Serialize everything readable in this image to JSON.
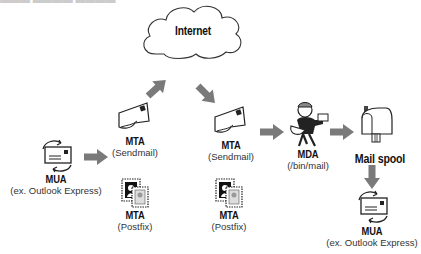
{
  "diagram": {
    "cloud": {
      "label": "Internet"
    },
    "nodes": [
      {
        "id": "mua-sender",
        "title": "MUA",
        "subtitle": "(ex. Outlook Express)",
        "icon": "mail-client-icon"
      },
      {
        "id": "mta-sendmail-1",
        "title": "MTA",
        "subtitle": "(Sendmail)",
        "icon": "envelope-hand-icon"
      },
      {
        "id": "mta-postfix-1",
        "title": "MTA",
        "subtitle": "(Postfix)",
        "icon": "postage-stamp-icon"
      },
      {
        "id": "mta-sendmail-2",
        "title": "MTA",
        "subtitle": "(Sendmail)",
        "icon": "envelope-hand-icon"
      },
      {
        "id": "mta-postfix-2",
        "title": "MTA",
        "subtitle": "(Postfix)",
        "icon": "postage-stamp-icon"
      },
      {
        "id": "mda",
        "title": "MDA",
        "subtitle": "(/bin/mail)",
        "icon": "mail-carrier-icon"
      },
      {
        "id": "mail-spool",
        "title": "Mail spool",
        "subtitle": "",
        "icon": "mailbox-icon"
      },
      {
        "id": "mua-receiver",
        "title": "MUA",
        "subtitle": "(ex. Outlook Express)",
        "icon": "mail-client-icon"
      }
    ],
    "edges": [
      {
        "from": "mua-sender",
        "to": "mta-sendmail-1"
      },
      {
        "from": "mta-sendmail-1",
        "to": "internet"
      },
      {
        "from": "internet",
        "to": "mta-sendmail-2"
      },
      {
        "from": "mta-sendmail-2",
        "to": "mda"
      },
      {
        "from": "mda",
        "to": "mail-spool"
      },
      {
        "from": "mail-spool",
        "to": "mua-receiver"
      }
    ],
    "colors": {
      "arrow": "#7a7a7a",
      "stroke": "#222222"
    }
  }
}
